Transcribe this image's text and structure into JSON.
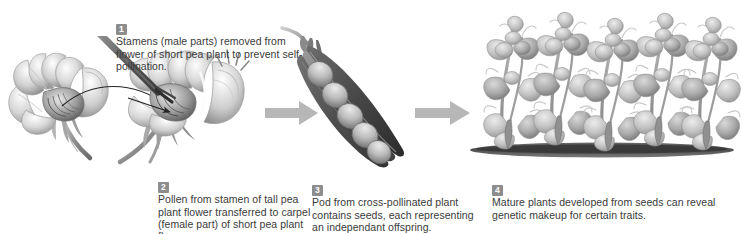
{
  "figure": {
    "background_color": "#ffffff",
    "text_color": "#3a3a3a",
    "badge_color": "#8d8d8d",
    "arrow_color": "#b4b4b4"
  },
  "steps": [
    {
      "number": "1",
      "text": "Stamens (male parts) removed from flower of short pea plant to prevent self-pollination.",
      "illustration": "pea-flower-with-tweezers"
    },
    {
      "number": "2",
      "text": "Pollen from stamen of tall pea plant flower transferred to carpel (female part) of short pea plant flower.",
      "illustration": "pea-flower-pollen-transfer"
    },
    {
      "number": "3",
      "text": "Pod from cross-pollinated plant contains seeds, each representing an independant offspring.",
      "illustration": "open-pea-pod-with-seeds"
    },
    {
      "number": "4",
      "text": "Mature plants developed from seeds can reveal genetic makeup for certain traits.",
      "illustration": "row-of-mature-pea-plants"
    }
  ],
  "illustration_details": {
    "pod_seed_count": 5,
    "mature_plant_count": 5,
    "arrow_count": 2,
    "transfer_arrow": "curved-arrow-flower-one-to-flower-two"
  }
}
